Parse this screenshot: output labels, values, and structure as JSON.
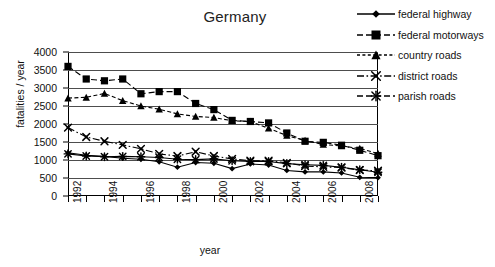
{
  "chart_data": {
    "type": "line",
    "title": "Germany",
    "xlabel": "year",
    "ylabel": "fatalities / year",
    "xlim": [
      1992,
      2009
    ],
    "ylim": [
      0,
      4000
    ],
    "ytick_step": 500,
    "grid": "horizontal",
    "legend_position": "top-right",
    "x": [
      1992,
      1993,
      1994,
      1995,
      1996,
      1997,
      1998,
      1999,
      2000,
      2001,
      2002,
      2003,
      2004,
      2005,
      2006,
      2007,
      2008,
      2009
    ],
    "xtick_labels": [
      "1992",
      "1994",
      "1996",
      "1998",
      "2000",
      "2002",
      "2004",
      "2006",
      "2008"
    ],
    "ytick_labels": [
      "0",
      "500",
      "1000",
      "1500",
      "2000",
      "2500",
      "3000",
      "3500",
      "4000"
    ],
    "series": [
      {
        "name": "federal highway",
        "marker": "diamond",
        "line": "solid",
        "values": [
          1200,
          1130,
          1100,
          1050,
          1020,
          950,
          800,
          930,
          910,
          760,
          890,
          860,
          710,
          670,
          670,
          640,
          520,
          510
        ]
      },
      {
        "name": "federal motorways",
        "marker": "square",
        "line": "dashed",
        "values": [
          3600,
          3250,
          3200,
          3250,
          2840,
          2900,
          2900,
          2570,
          2400,
          2100,
          2070,
          2030,
          1750,
          1520,
          1490,
          1410,
          1270,
          1120
        ]
      },
      {
        "name": "country roads",
        "marker": "triangle",
        "line": "dotted-dash",
        "values": [
          2720,
          2740,
          2850,
          2650,
          2500,
          2410,
          2280,
          2210,
          2180,
          2090,
          2070,
          1880,
          1680,
          1540,
          1430,
          1390,
          1320,
          1180
        ]
      },
      {
        "name": "district roads",
        "marker": "x-cross",
        "line": "dash-dot",
        "values": [
          1900,
          1640,
          1520,
          1420,
          1310,
          1170,
          1110,
          1230,
          1110,
          1030,
          980,
          980,
          920,
          830,
          810,
          790,
          720,
          700
        ]
      },
      {
        "name": "parish roads",
        "marker": "asterisk",
        "line": "solid-marker",
        "values": [
          1170,
          1110,
          1090,
          1100,
          1090,
          1070,
          1020,
          1010,
          1030,
          980,
          960,
          960,
          900,
          870,
          850,
          800,
          730,
          660
        ]
      }
    ]
  },
  "axes": {
    "y_title": "fatalities / year",
    "x_title": "year"
  },
  "legend": {
    "items": [
      {
        "label": "federal highway",
        "marker": "diamond",
        "line": "solid"
      },
      {
        "label": "federal motorways",
        "marker": "square",
        "line": "dashed"
      },
      {
        "label": "country roads",
        "marker": "triangle",
        "line": "dotted"
      },
      {
        "label": "district roads",
        "marker": "x-cross",
        "line": "dash-dot"
      },
      {
        "label": "parish roads",
        "marker": "asterisk",
        "line": "dashed"
      }
    ]
  }
}
